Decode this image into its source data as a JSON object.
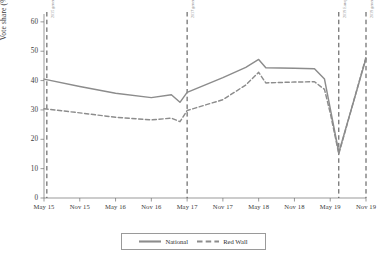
{
  "chart_data": {
    "type": "line",
    "title": "",
    "xlabel": "",
    "ylabel": "Vote share (%)",
    "ylim": [
      0,
      62
    ],
    "yticks": [
      0,
      10,
      20,
      30,
      40,
      50,
      60
    ],
    "grid": false,
    "legend_position": "bottom",
    "x": [
      "May 15",
      "Nov 15",
      "May 16",
      "Nov 16",
      "May 17",
      "Nov 17",
      "May 18",
      "Nov 18",
      "May 19",
      "Nov 19"
    ],
    "xticks": [
      "May 15",
      "Nov 15",
      "May 16",
      "Nov 16",
      "May 17",
      "Nov 17",
      "May 18",
      "Nov 18",
      "May 19",
      "Nov 19"
    ],
    "series": [
      {
        "name": "National",
        "style": "solid",
        "color": "#8c8c8c",
        "points": [
          {
            "x": "May 15",
            "t": 0.0,
            "y": 40.5
          },
          {
            "x": "Nov 15",
            "t": 0.5,
            "y": 38.0
          },
          {
            "x": "May 16",
            "t": 1.0,
            "y": 35.7
          },
          {
            "x": "Nov 16",
            "t": 1.5,
            "y": 34.2
          },
          {
            "x": "Feb 17",
            "t": 1.78,
            "y": 35.2
          },
          {
            "x": "Apr 17",
            "t": 1.9,
            "y": 32.6
          },
          {
            "x": "May 17",
            "t": 2.0,
            "y": 36.0
          },
          {
            "x": "Nov 17",
            "t": 2.5,
            "y": 41.0
          },
          {
            "x": "Mar 18",
            "t": 2.82,
            "y": 44.5
          },
          {
            "x": "May 18",
            "t": 3.0,
            "y": 47.2
          },
          {
            "x": "Jul 18",
            "t": 3.1,
            "y": 44.4
          },
          {
            "x": "Nov 18",
            "t": 3.5,
            "y": 44.2
          },
          {
            "x": "Feb 19",
            "t": 3.78,
            "y": 44.0
          },
          {
            "x": "Apr 19",
            "t": 3.92,
            "y": 40.5
          },
          {
            "x": "May 19",
            "t": 4.0,
            "y": 30.5
          },
          {
            "x": "May 19b",
            "t": 4.12,
            "y": 15.5
          },
          {
            "x": "Nov 19",
            "t": 4.5,
            "y": 47.5
          }
        ]
      },
      {
        "name": "Red Wall",
        "style": "dashed",
        "color": "#8c8c8c",
        "points": [
          {
            "x": "May 15",
            "t": 0.0,
            "y": 30.4
          },
          {
            "x": "Nov 15",
            "t": 0.5,
            "y": 29.0
          },
          {
            "x": "May 16",
            "t": 1.0,
            "y": 27.5
          },
          {
            "x": "Nov 16",
            "t": 1.5,
            "y": 26.6
          },
          {
            "x": "Feb 17",
            "t": 1.78,
            "y": 27.2
          },
          {
            "x": "Apr 17",
            "t": 1.9,
            "y": 26.0
          },
          {
            "x": "May 17",
            "t": 2.0,
            "y": 29.8
          },
          {
            "x": "Nov 17",
            "t": 2.5,
            "y": 33.5
          },
          {
            "x": "Mar 18",
            "t": 2.82,
            "y": 38.5
          },
          {
            "x": "May 18",
            "t": 3.0,
            "y": 42.8
          },
          {
            "x": "Jul 18",
            "t": 3.1,
            "y": 39.2
          },
          {
            "x": "Nov 18",
            "t": 3.5,
            "y": 39.5
          },
          {
            "x": "Feb 19",
            "t": 3.78,
            "y": 39.6
          },
          {
            "x": "Apr 19",
            "t": 3.92,
            "y": 37.0
          },
          {
            "x": "May 19",
            "t": 4.0,
            "y": 29.0
          },
          {
            "x": "May 19b",
            "t": 4.12,
            "y": 15.0
          },
          {
            "x": "Nov 19",
            "t": 4.5,
            "y": 48.0
          }
        ]
      }
    ],
    "event_lines": [
      {
        "label": "2015 general election",
        "t": 0.04
      },
      {
        "label": "2017 general election",
        "t": 2.0
      },
      {
        "label": "2019 European election",
        "t": 4.12
      },
      {
        "label": "2019 general election",
        "t": 4.5
      }
    ]
  },
  "legend": {
    "items": [
      {
        "label": "National",
        "style": "solid"
      },
      {
        "label": "Red Wall",
        "style": "dashed"
      }
    ]
  },
  "colors": {
    "line": "#8c8c8c",
    "axis": "#6f6f6f",
    "event_line": "#4a4a4a",
    "text": "#3a3a3a",
    "event_text": "#8a8a8a"
  }
}
